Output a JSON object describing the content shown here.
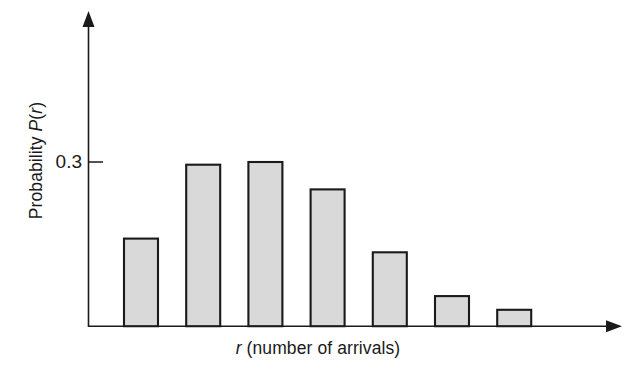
{
  "chart_data": {
    "type": "bar",
    "title": "",
    "subtitle": "",
    "xlabel_parts": {
      "symbol": "r",
      "rest": " (number of arrivals)"
    },
    "xlabel": "r (number of arrivals)",
    "ylabel_parts": {
      "prefix": "Probability ",
      "symbol": "P",
      "suffix": "(r)"
    },
    "ylabel": "Probability P(r)",
    "categories": [
      "0",
      "1",
      "2",
      "3",
      "4",
      "5",
      "6"
    ],
    "values": [
      0.16,
      0.295,
      0.3,
      0.25,
      0.135,
      0.055,
      0.03
    ],
    "ylim": [
      0,
      0.42
    ],
    "xlim": [
      0,
      7
    ],
    "y_ticks": [
      0.3
    ],
    "y_tick_labels": [
      "0.3"
    ],
    "x_ticks": [],
    "x_tick_labels": [],
    "grid": false,
    "legend": null,
    "legend_position": "none",
    "bar_fill": "#d9d9d9",
    "bar_edge": "#1a1a1a",
    "axis_color": "#1a1a1a",
    "background": "#ffffff",
    "annotations": []
  },
  "axes": {
    "y_tick_label_0": "0.3"
  }
}
